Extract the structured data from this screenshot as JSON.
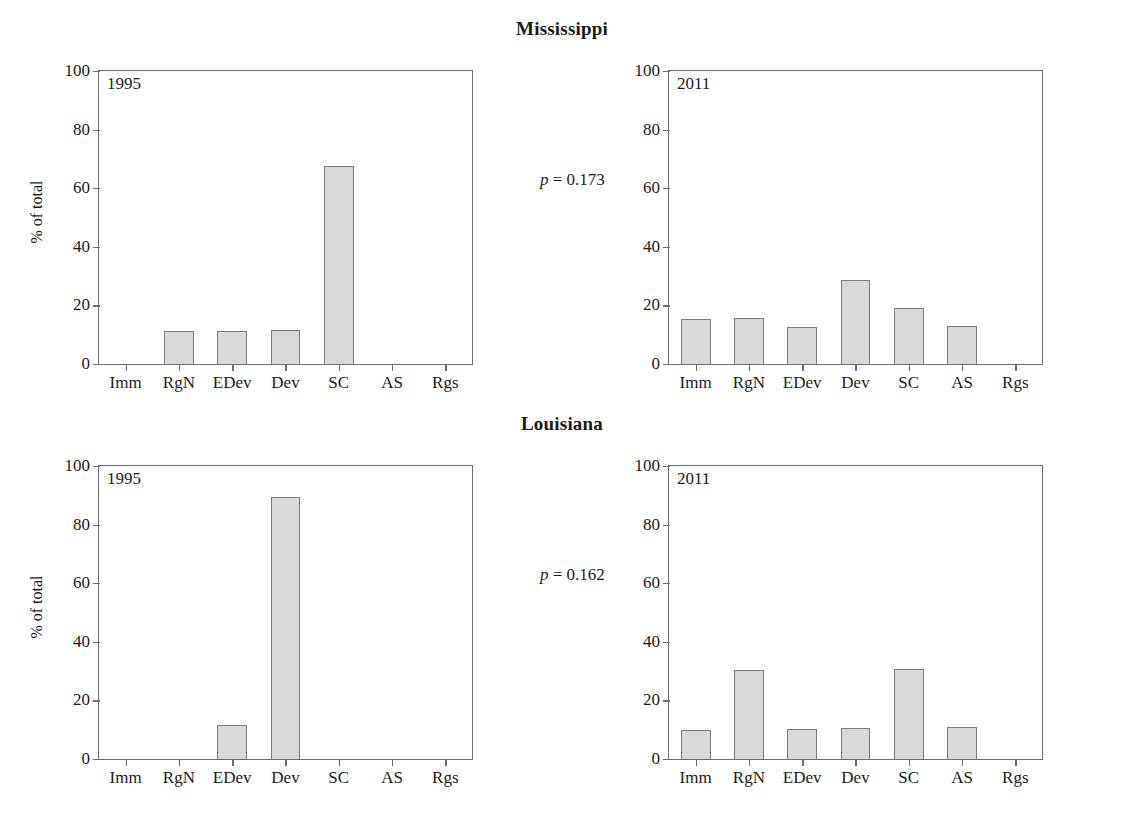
{
  "figure": {
    "y_axis_label": "% of total",
    "y_ticks": [
      "100",
      "80",
      "60",
      "40",
      "20",
      "0"
    ],
    "categories": [
      "Imm",
      "RgN",
      "EDev",
      "Dev",
      "SC",
      "AS",
      "Rgs"
    ]
  },
  "rows": [
    {
      "title": "Mississippi",
      "p_symbol": "p",
      "p_text": " = 0.173",
      "panels": [
        {
          "year": "1995"
        },
        {
          "year": "2011"
        }
      ]
    },
    {
      "title": "Louisiana",
      "p_symbol": "p",
      "p_text": " = 0.162",
      "panels": [
        {
          "year": "1995"
        },
        {
          "year": "2011"
        }
      ]
    }
  ],
  "chart_data": [
    {
      "type": "bar",
      "title": "Mississippi",
      "panel": "1995",
      "categories": [
        "Imm",
        "RgN",
        "EDev",
        "Dev",
        "SC",
        "AS",
        "Rgs"
      ],
      "values": [
        0,
        11.4,
        11.4,
        11.7,
        67.5,
        0,
        0
      ],
      "xlabel": "",
      "ylabel": "% of total",
      "ylim": [
        0,
        100
      ],
      "yticks": [
        0,
        20,
        40,
        60,
        80,
        100
      ],
      "grid": false,
      "annotation": "p = 0.173"
    },
    {
      "type": "bar",
      "title": "Mississippi",
      "panel": "2011",
      "categories": [
        "Imm",
        "RgN",
        "EDev",
        "Dev",
        "SC",
        "AS",
        "Rgs"
      ],
      "values": [
        15.5,
        15.6,
        12.5,
        28.6,
        19.0,
        13.0,
        0
      ],
      "xlabel": "",
      "ylabel": "",
      "ylim": [
        0,
        100
      ],
      "yticks": [
        0,
        20,
        40,
        60,
        80,
        100
      ],
      "grid": false,
      "annotation": "p = 0.173"
    },
    {
      "type": "bar",
      "title": "Louisiana",
      "panel": "1995",
      "categories": [
        "Imm",
        "RgN",
        "EDev",
        "Dev",
        "SC",
        "AS",
        "Rgs"
      ],
      "values": [
        0,
        0,
        11.5,
        89.5,
        0,
        0,
        0
      ],
      "xlabel": "",
      "ylabel": "% of total",
      "ylim": [
        0,
        100
      ],
      "yticks": [
        0,
        20,
        40,
        60,
        80,
        100
      ],
      "grid": false,
      "annotation": "p = 0.162"
    },
    {
      "type": "bar",
      "title": "Louisiana",
      "panel": "2011",
      "categories": [
        "Imm",
        "RgN",
        "EDev",
        "Dev",
        "SC",
        "AS",
        "Rgs"
      ],
      "values": [
        10.0,
        30.3,
        10.3,
        10.5,
        30.8,
        10.8,
        0
      ],
      "xlabel": "",
      "ylabel": "",
      "ylim": [
        0,
        100
      ],
      "yticks": [
        0,
        20,
        40,
        60,
        80,
        100
      ],
      "grid": false,
      "annotation": "p = 0.162"
    }
  ],
  "style": {
    "bar_fill": "#d9d9d9",
    "bar_stroke": "#7a7a7a",
    "axis_color": "#6c6c6c",
    "text_color": "#1a1a1a"
  }
}
